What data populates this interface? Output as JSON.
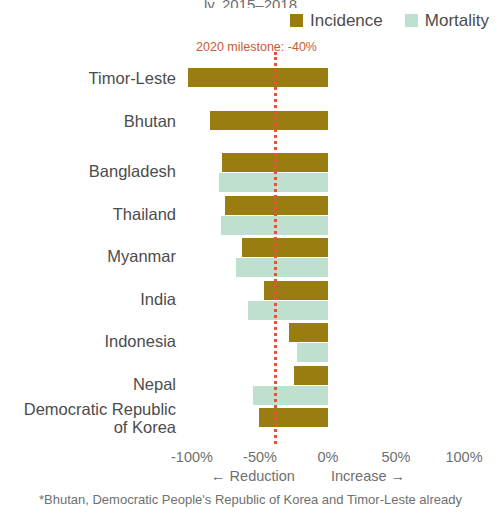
{
  "title_sliver": "ly, 2015–2018",
  "legend": {
    "items": [
      {
        "label": "Incidence",
        "color": "#9a7d10",
        "name": "legend-incidence"
      },
      {
        "label": "Mortality",
        "color": "#bfe0ce",
        "name": "legend-mortality"
      }
    ]
  },
  "annotation": {
    "milestone_text": "2020 milestone: -40%",
    "milestone_color": "#e0553a",
    "milestone_value": -40
  },
  "axis": {
    "ticks": [
      "-100%",
      "-50%",
      "0%",
      "50%",
      "100%"
    ],
    "tick_values": [
      -100,
      -50,
      0,
      50,
      100
    ],
    "direction_left": "← Reduction",
    "direction_right": "Increase →"
  },
  "footnote": "*Bhutan, Democratic People's Republic of Korea and Timor-Leste already",
  "chart_data": {
    "type": "bar",
    "orientation": "horizontal",
    "title": "ly, 2015–2018",
    "xlabel": "",
    "ylabel": "",
    "xlim": [
      -100,
      100
    ],
    "grid": false,
    "legend_position": "top-right",
    "categories": [
      "Timor-Leste",
      "Bhutan",
      "Bangladesh",
      "Thailand",
      "Myanmar",
      "India",
      "Indonesia",
      "Nepal",
      "Democratic Republic\nof Korea"
    ],
    "series": [
      {
        "name": "Incidence",
        "color": "#9a7d10",
        "values": [
          -103,
          -87,
          -78,
          -76,
          -63,
          -47,
          -29,
          -25,
          -51
        ]
      },
      {
        "name": "Mortality",
        "color": "#bfe0ce",
        "values": [
          null,
          null,
          -80,
          -79,
          -68,
          -59,
          -23,
          -55,
          null
        ]
      }
    ],
    "annotations": [
      {
        "type": "vline",
        "value": -40,
        "label": "2020 milestone: -40%",
        "color": "#e0553a",
        "style": "dotted"
      }
    ]
  }
}
